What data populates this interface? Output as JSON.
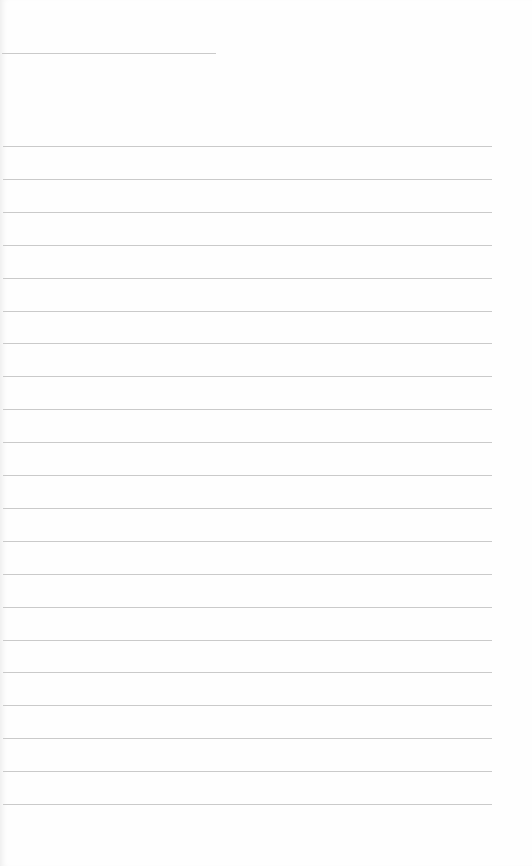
{
  "sheet": {
    "type": "lined-paper",
    "background_color": "#fefefe",
    "line_color": "#cacaca",
    "header_line": {
      "x": 2,
      "y": 53,
      "width": 214
    },
    "rules": {
      "count": 21,
      "first_y": 146,
      "spacing": 32.9,
      "x": 3,
      "width": 489
    }
  }
}
